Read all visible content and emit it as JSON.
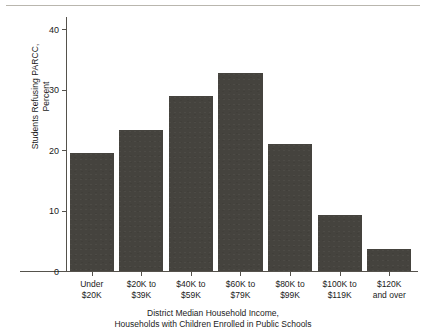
{
  "chart_data": {
    "type": "bar",
    "title": "",
    "xlabel": "District Median Household Income,\nHouseholds with Children Enrolled in Public Schools",
    "ylabel": "Students Refusing PARCC,\nPercent",
    "categories": [
      "Under\n$20K",
      "$20K to\n$39K",
      "$40K to\n$59K",
      "$60K to\n$79K",
      "$80K to\n$99K",
      "$100K to\n$119K",
      "$120K\nand over"
    ],
    "values": [
      19.5,
      23.3,
      28.9,
      32.8,
      21.0,
      9.2,
      3.6
    ],
    "ylim": [
      0,
      42
    ],
    "yticks": [
      0,
      10,
      20,
      30,
      40
    ],
    "ytick_labels": [
      "0",
      "10",
      "20",
      "30",
      "40"
    ],
    "grid": false,
    "legend": null,
    "bar_color": "#45433E",
    "axis_color": "#55524C"
  }
}
